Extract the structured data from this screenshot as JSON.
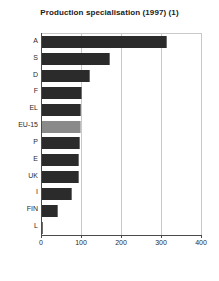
{
  "chart_data": {
    "type": "bar",
    "orientation": "horizontal",
    "title": "Production specialisation (1997) (1)",
    "xlabel": "",
    "ylabel": "",
    "categories": [
      "A",
      "S",
      "D",
      "F",
      "EL",
      "EU-15",
      "P",
      "E",
      "UK",
      "I",
      "FIN",
      "L"
    ],
    "values": [
      315,
      172,
      122,
      103,
      101,
      100,
      97,
      96,
      94,
      78,
      43,
      3
    ],
    "xlim": [
      0,
      400
    ],
    "xticks": [
      0,
      100,
      200,
      300,
      400
    ],
    "xtick_labels": [
      "0",
      "100",
      "200",
      "300",
      "400"
    ],
    "grid": "vertical",
    "legend": "none",
    "highlight_category": "EU-15",
    "colors": {
      "bar": "#2b2b2b",
      "bar_highlight": "#8a8a8a",
      "gridline": "#c8c8c8",
      "axis": "#4a4a4a",
      "text": "#2a2a2a",
      "background": "#ffffff"
    }
  }
}
